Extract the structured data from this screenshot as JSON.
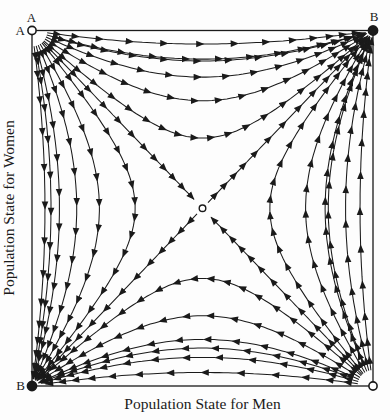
{
  "figure": {
    "background": "#fdfdfd",
    "ink": "#1a1a1a"
  },
  "axis_labels": {
    "x": "Population State for Men",
    "y": "Population State for Women"
  },
  "corner_labels": [
    {
      "text": "A",
      "corner": "top-left",
      "side": "above"
    },
    {
      "text": "A",
      "corner": "top-left",
      "side": "left"
    },
    {
      "text": "B",
      "corner": "top-right",
      "side": "above"
    },
    {
      "text": "B",
      "corner": "bottom-left",
      "side": "left"
    }
  ],
  "chart_data": {
    "type": "quiver",
    "title": "",
    "xlabel": "Population State for Men",
    "ylabel": "Population State for Women",
    "xlim": [
      0,
      1
    ],
    "ylim": [
      0,
      1
    ],
    "grid": false,
    "field": {
      "du": "u*(1-u)*(a*v+b)",
      "dv": "v*(1-v)*(c*u+d)",
      "a": 2,
      "b": -1,
      "c": 2,
      "d": -1
    },
    "equilibria": [
      {
        "name": "top-left",
        "u": 0,
        "v": 1,
        "stability": "source",
        "marker": "open"
      },
      {
        "name": "top-right",
        "u": 1,
        "v": 1,
        "stability": "sink",
        "marker": "filled"
      },
      {
        "name": "bottom-left",
        "u": 0,
        "v": 0,
        "stability": "sink",
        "marker": "filled"
      },
      {
        "name": "bottom-right",
        "u": 1,
        "v": 0,
        "stability": "source",
        "marker": "open"
      },
      {
        "name": "saddle",
        "u": 0.5,
        "v": 0.5,
        "stability": "saddle",
        "marker": "open"
      }
    ],
    "streamlines": {
      "corner_fan_angles_deg": [
        8,
        16,
        24,
        32,
        40,
        45,
        50,
        58,
        66,
        74,
        82
      ],
      "fan_seed_radius": 0.045,
      "edge_seeds": [
        [
          0.06,
          0.982
        ],
        [
          0.012,
          0.94
        ],
        [
          0.972,
          0.06
        ],
        [
          0.94,
          0.022
        ]
      ],
      "saddle_outflow_seeds": [
        [
          0.516,
          0.516
        ],
        [
          0.484,
          0.484
        ]
      ],
      "arrow_spacing_time": 0.45,
      "min_span_px": 13,
      "max_span_px": 42
    }
  }
}
